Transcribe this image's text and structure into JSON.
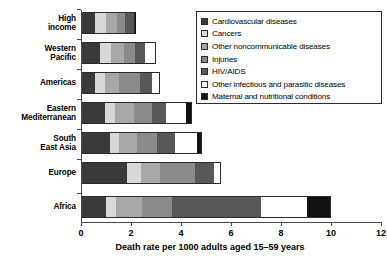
{
  "chart_data": {
    "type": "bar",
    "orientation": "horizontal",
    "stacked": true,
    "title": "",
    "xlabel": "Death rate per 1000 adults aged 15–59 years",
    "ylabel": "",
    "xlim": [
      0,
      12
    ],
    "xticks": [
      0,
      2,
      4,
      6,
      8,
      10,
      12
    ],
    "xtick_labels": [
      "0",
      "2",
      "4",
      "6",
      "8",
      "10",
      "12"
    ],
    "grid": false,
    "legend_position": "top-right",
    "categories": [
      "High income",
      "Western Pacific",
      "Americas",
      "Eastern Mediterranean",
      "South East Asia",
      "Europe",
      "Africa"
    ],
    "series": [
      {
        "name": "Cardiovascular diseases",
        "color": "#3b3a3a",
        "values": [
          0.55,
          0.75,
          0.55,
          0.95,
          1.15,
          1.85,
          1.0
        ]
      },
      {
        "name": "Cancers",
        "color": "#d8d8d8",
        "values": [
          0.45,
          0.45,
          0.4,
          0.4,
          0.35,
          0.55,
          0.4
        ]
      },
      {
        "name": "Other noncommunicable diseases",
        "color": "#a8a8a8",
        "values": [
          0.45,
          0.5,
          0.55,
          0.75,
          0.75,
          0.75,
          1.05
        ]
      },
      {
        "name": "Injuries",
        "color": "#8b8b8b",
        "values": [
          0.3,
          0.45,
          0.85,
          0.75,
          0.8,
          1.4,
          1.2
        ]
      },
      {
        "name": "HIV/AIDS",
        "color": "#595858",
        "values": [
          0.35,
          0.4,
          0.5,
          0.55,
          0.7,
          0.75,
          3.55
        ]
      },
      {
        "name": "Other infectious and parasitic diseases",
        "color": "#ffffff",
        "values": [
          0.05,
          0.4,
          0.25,
          0.8,
          0.9,
          0.25,
          1.85
        ]
      },
      {
        "name": "Maternal and nutritional conditions",
        "color": "#111111",
        "values": [
          0.02,
          0.03,
          0.05,
          0.25,
          0.2,
          0.05,
          0.95
        ]
      }
    ],
    "totals": [
      2.17,
      2.98,
      3.15,
      4.45,
      4.85,
      5.6,
      10.0
    ]
  },
  "legend": {
    "items": [
      {
        "label": "Cardiovascular diseases",
        "swatch": "cvd-swatch"
      },
      {
        "label": "Cancers",
        "swatch": "cancers-swatch"
      },
      {
        "label": "Other noncommunicable diseases",
        "swatch": "noncommunicable-swatch"
      },
      {
        "label": "Injuries",
        "swatch": "injuries-swatch"
      },
      {
        "label": "HIV/AIDS",
        "swatch": "hiv-aids-swatch"
      },
      {
        "label": "Other infectious and parasitic diseases",
        "swatch": "other-infectious-swatch"
      },
      {
        "label": "Maternal and nutritional conditions",
        "swatch": "maternal-swatch"
      }
    ]
  },
  "axis": {
    "x_title": "Death rate per 1000 adults aged 15–59 years",
    "tick_labels": [
      "0",
      "2",
      "4",
      "6",
      "8",
      "10",
      "12"
    ]
  },
  "category_labels": [
    [
      "High",
      "income"
    ],
    [
      "Western",
      "Pacific"
    ],
    [
      "Americas"
    ],
    [
      "Eastern",
      "Mediterranean"
    ],
    [
      "South",
      "East Asia"
    ],
    [
      "Europe"
    ],
    [
      "Africa"
    ]
  ]
}
